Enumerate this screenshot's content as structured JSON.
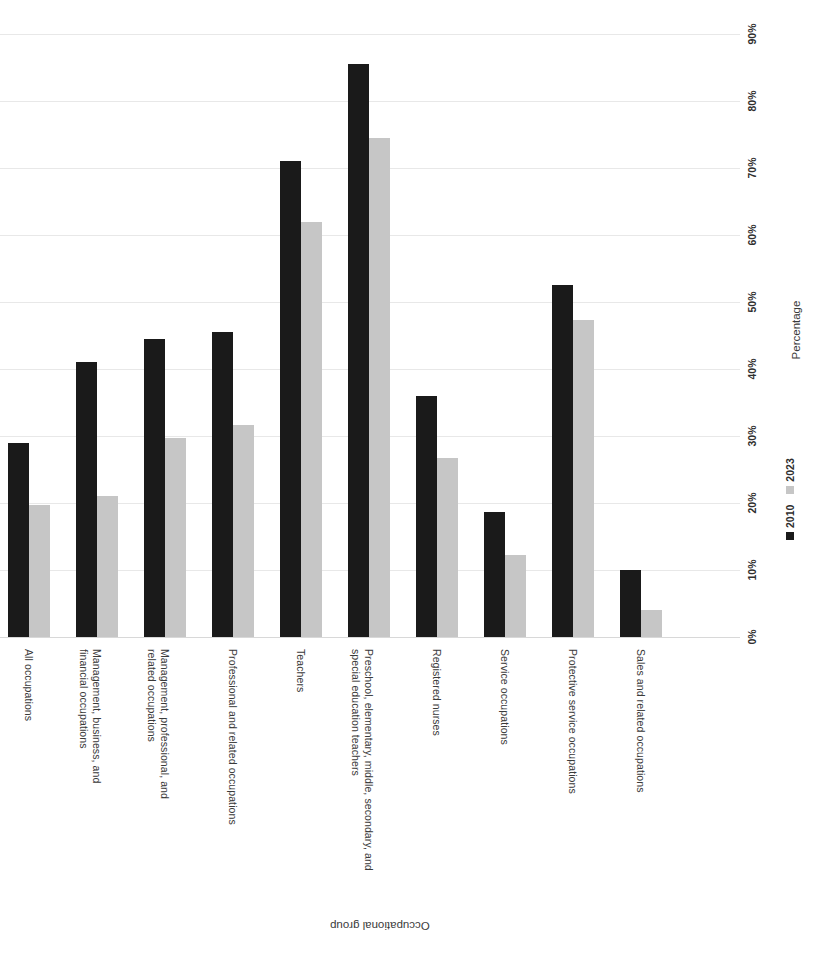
{
  "chart_data": {
    "type": "bar",
    "title": "",
    "orientation": "rotated-90",
    "xlabel": "Occupational group",
    "ylabel": "Percentage",
    "ylim": [
      0,
      90
    ],
    "ytick_step": 10,
    "grid": true,
    "legend_position": "right",
    "tick_labels": [
      "0%",
      "10%",
      "20%",
      "30%",
      "40%",
      "50%",
      "60%",
      "70%",
      "80%",
      "90%"
    ],
    "categories": [
      "All occupations",
      "Management, business, and financial occupations",
      "Management, professional, and related occupations",
      "Professional and related occupations",
      "Teachers",
      "Preschool, elementary, middle, secondary, and special education teachers",
      "Registered nurses",
      "Service occupations",
      "Protective service occupations",
      "Sales and related occupations"
    ],
    "category_lines": [
      [
        "All occupations"
      ],
      [
        "Management, business, and",
        "financial occupations"
      ],
      [
        "Management, professional, and",
        "related occupations"
      ],
      [
        "Professional and related occupations"
      ],
      [
        "Teachers"
      ],
      [
        "Preschool, elementary, middle, secondary, and",
        "special education teachers"
      ],
      [
        "Registered nurses"
      ],
      [
        "Service occupations"
      ],
      [
        "Protective service occupations"
      ],
      [
        "Sales and related occupations"
      ]
    ],
    "series": [
      {
        "name": "2010",
        "color": "#1a1a1a",
        "values": [
          29,
          41,
          44.5,
          45.5,
          71,
          85.5,
          36,
          18.7,
          52.5,
          10
        ]
      },
      {
        "name": "2023",
        "color": "#c6c6c6",
        "values": [
          19.7,
          21,
          29.7,
          31.6,
          62,
          74.5,
          26.7,
          12.2,
          47.3,
          4
        ]
      }
    ]
  },
  "legend": {
    "items": [
      {
        "label": "2010",
        "color": "#1a1a1a"
      },
      {
        "label": "2023",
        "color": "#c6c6c6"
      }
    ]
  },
  "axes": {
    "value_axis_title": "Percentage",
    "category_axis_title": "Occupational group"
  }
}
